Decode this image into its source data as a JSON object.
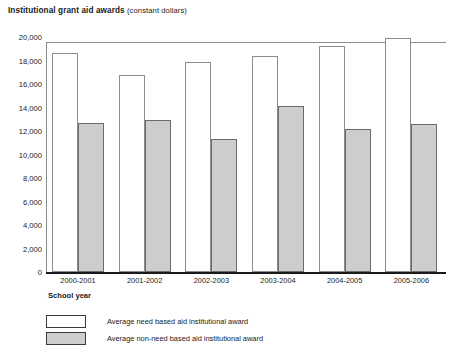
{
  "chart_data": {
    "type": "bar",
    "title": "Institutional grant aid awards",
    "title_suffix": "(constant dollars)",
    "xlabel": "School year",
    "ylabel": "",
    "categories": [
      "2000-2001",
      "2001-2002",
      "2002-2003",
      "2003-2004",
      "2004-2005",
      "2005-2006"
    ],
    "series": [
      {
        "name": "Average need based aid institutional award",
        "color": "#ffffff",
        "values": [
          18600,
          16800,
          17900,
          18400,
          19200,
          19900
        ]
      },
      {
        "name": "Average non-need based aid institutional award",
        "color": "#cdcdcd",
        "values": [
          12700,
          12900,
          11300,
          14100,
          12200,
          12600
        ]
      }
    ],
    "ylim": [
      0,
      20000
    ],
    "yticks": [
      "0",
      "2,000",
      "4,000",
      "6,000",
      "8,000",
      "10,000",
      "12,000",
      "14,000",
      "16,000",
      "18,000",
      "20,000"
    ],
    "ytick_values": [
      0,
      2000,
      4000,
      6000,
      8000,
      10000,
      12000,
      14000,
      16000,
      18000,
      20000
    ],
    "grid": false,
    "legend_position": "bottom-left"
  }
}
